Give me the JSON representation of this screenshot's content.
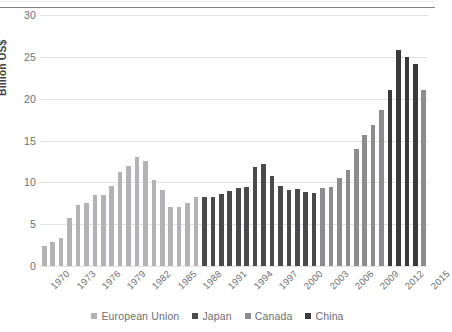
{
  "chart_data": {
    "type": "bar",
    "title": "",
    "xlabel": "",
    "ylabel": "Billion US$",
    "ylim": [
      0,
      30
    ],
    "yticks": [
      0,
      5,
      10,
      15,
      20,
      25,
      30
    ],
    "grid": true,
    "legend_position": "bottom",
    "x": [
      1970,
      1971,
      1972,
      1973,
      1974,
      1975,
      1976,
      1977,
      1978,
      1979,
      1980,
      1981,
      1982,
      1983,
      1984,
      1985,
      1986,
      1987,
      1988,
      1989,
      1990,
      1991,
      1992,
      1993,
      1994,
      1995,
      1996,
      1997,
      1998,
      1999,
      2000,
      2001,
      2002,
      2003,
      2004,
      2005,
      2006,
      2007,
      2008,
      2009,
      2010,
      2011,
      2012,
      2013,
      2014,
      2015
    ],
    "xtick_labels": [
      "1970",
      "1973",
      "1976",
      "1979",
      "1982",
      "1985",
      "1988",
      "1991",
      "1994",
      "1997",
      "2000",
      "2003",
      "2006",
      "2009",
      "2012",
      "2015"
    ],
    "values": [
      2.4,
      2.9,
      3.3,
      5.7,
      7.3,
      7.5,
      8.5,
      8.5,
      9.6,
      11.2,
      11.9,
      13.0,
      12.6,
      10.3,
      9.1,
      7.0,
      7.1,
      7.5,
      8.3,
      8.3,
      8.2,
      8.6,
      9.0,
      9.3,
      9.5,
      11.8,
      12.2,
      10.7,
      9.6,
      9.1,
      9.2,
      8.9,
      8.7,
      9.3,
      9.5,
      10.5,
      11.5,
      14.0,
      15.7,
      16.9,
      18.6,
      21.0,
      25.8,
      25.0,
      24.1,
      21.0
    ],
    "colors": {
      "european_union": "#b3b3b5",
      "japan": "#4a4a4d",
      "canada": "#8c8c8f",
      "china": "#3a3a3c"
    },
    "group_by_bar": [
      "european_union",
      "european_union",
      "european_union",
      "european_union",
      "european_union",
      "european_union",
      "european_union",
      "european_union",
      "european_union",
      "european_union",
      "european_union",
      "european_union",
      "european_union",
      "european_union",
      "european_union",
      "european_union",
      "european_union",
      "european_union",
      "european_union",
      "japan",
      "japan",
      "japan",
      "japan",
      "japan",
      "japan",
      "japan",
      "japan",
      "japan",
      "japan",
      "japan",
      "japan",
      "japan",
      "japan",
      "canada",
      "canada",
      "canada",
      "canada",
      "canada",
      "canada",
      "canada",
      "canada",
      "china",
      "china",
      "china",
      "china",
      "canada"
    ],
    "legend": [
      {
        "label": "European Union",
        "color": "#b3b3b5"
      },
      {
        "label": "Japan",
        "color": "#4a4a4d"
      },
      {
        "label": "Canada",
        "color": "#8c8c8f"
      },
      {
        "label": "China",
        "color": "#3a3a3c"
      }
    ]
  }
}
